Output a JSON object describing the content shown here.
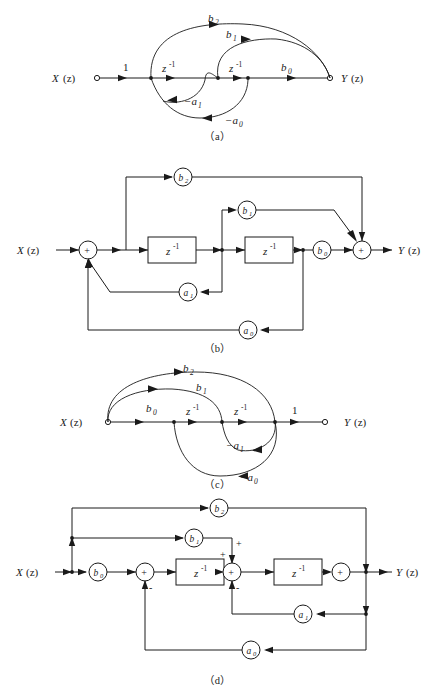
{
  "figure": {
    "title_absent": true,
    "background": "#ffffff",
    "line_color": "#1a1a1a"
  },
  "symbols": {
    "input": "X",
    "output": "Y",
    "arg": "(z)",
    "delay_base": "z",
    "delay_exp": "-1",
    "unity": "1",
    "plus": "+",
    "minus": "-",
    "b0": "b",
    "b0s": "0",
    "b1": "b",
    "b1s": "1",
    "b2": "b",
    "b2s": "2",
    "a0": "a",
    "a0s": "0",
    "a1": "a",
    "a1s": "1",
    "neg_a0": "−a",
    "neg_a0s": "0",
    "neg_a1": "−a",
    "neg_a1s": "1"
  },
  "captions": {
    "a": "（a）",
    "b": "（b）",
    "c": "（c）",
    "d": "（d）"
  },
  "panels": [
    {
      "id": "a",
      "type": "signal-flow-graph",
      "caption": "（a）",
      "description": "Direct form II transposed signal flow graph, input X(z) on left",
      "source_label": "X(z)",
      "sink_label": "Y(z)",
      "forward_branch_gains": [
        "1",
        "z^-1",
        "z^-1",
        "b0"
      ],
      "feedforward_gains": [
        "b1",
        "b2"
      ],
      "feedback_gains": [
        "-a1",
        "-a0"
      ],
      "node_count": 4
    },
    {
      "id": "b",
      "type": "block-diagram",
      "caption": "（b）",
      "description": "Block diagram with two z^-1 delay blocks, gain circles b0 b1 b2 a0 a1, two summing junctions",
      "input_label": "X(z)",
      "output_label": "Y(z)",
      "delay_blocks": [
        "z^-1",
        "z^-1"
      ],
      "gains": [
        "b2",
        "b1",
        "b0",
        "a1",
        "a0"
      ],
      "adders": [
        "+",
        "+"
      ]
    },
    {
      "id": "c",
      "type": "signal-flow-graph",
      "caption": "（c）",
      "description": "Transposed signal flow graph, gains b0 b1 b2 leave source, unity gain at output",
      "source_label": "X(z)",
      "sink_label": "Y(z)",
      "forward_branch_gains": [
        "b0",
        "z^-1",
        "z^-1",
        "1"
      ],
      "feedforward_gains": [
        "b1",
        "b2"
      ],
      "feedback_gains": [
        "-a1",
        "-a0"
      ],
      "node_count": 4
    },
    {
      "id": "d",
      "type": "block-diagram",
      "caption": "（d）",
      "description": "Transposed block diagram, b0 gain at input, three adders with + and - signs, a0 a1 feedback",
      "input_label": "X(z)",
      "output_label": "Y(z)",
      "delay_blocks": [
        "z^-1",
        "z^-1"
      ],
      "gains": [
        "b2",
        "b1",
        "b0",
        "a1",
        "a0"
      ],
      "adders": [
        "+",
        "+",
        "+"
      ],
      "sign_marks": [
        "+",
        "+",
        "-",
        "-"
      ]
    }
  ]
}
